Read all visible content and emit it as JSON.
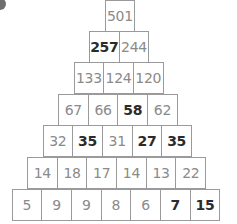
{
  "puzzle": {
    "type": "number-pyramid",
    "rows": [
      [
        {
          "value": "501",
          "given": false
        }
      ],
      [
        {
          "value": "257",
          "given": true
        },
        {
          "value": "244",
          "given": false
        }
      ],
      [
        {
          "value": "133",
          "given": false
        },
        {
          "value": "124",
          "given": false
        },
        {
          "value": "120",
          "given": false
        }
      ],
      [
        {
          "value": "67",
          "given": false
        },
        {
          "value": "66",
          "given": false
        },
        {
          "value": "58",
          "given": true
        },
        {
          "value": "62",
          "given": false
        }
      ],
      [
        {
          "value": "32",
          "given": false
        },
        {
          "value": "35",
          "given": true
        },
        {
          "value": "31",
          "given": false
        },
        {
          "value": "27",
          "given": true
        },
        {
          "value": "35",
          "given": true
        }
      ],
      [
        {
          "value": "14",
          "given": false
        },
        {
          "value": "18",
          "given": false
        },
        {
          "value": "17",
          "given": false
        },
        {
          "value": "14",
          "given": false
        },
        {
          "value": "13",
          "given": false
        },
        {
          "value": "22",
          "given": false
        }
      ],
      [
        {
          "value": "5",
          "given": false
        },
        {
          "value": "9",
          "given": false
        },
        {
          "value": "9",
          "given": false
        },
        {
          "value": "8",
          "given": false
        },
        {
          "value": "6",
          "given": false
        },
        {
          "value": "7",
          "given": true
        },
        {
          "value": "15",
          "given": true
        }
      ]
    ]
  },
  "colors": {
    "given_text": "#2b2b2b",
    "computed_text": "#8a8a8a",
    "border": "#9a9a9a"
  }
}
